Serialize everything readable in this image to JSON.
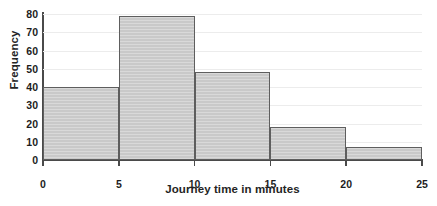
{
  "chart_data": {
    "type": "bar",
    "title": "",
    "subtitle": "",
    "xlabel": "Journey time in minutes",
    "ylabel": "Frequency",
    "categories": [
      "0-5",
      "5-10",
      "10-15",
      "15-20",
      "20-25"
    ],
    "bin_edges": [
      0,
      5,
      10,
      15,
      20,
      25
    ],
    "values": [
      40,
      79,
      48,
      18,
      7
    ],
    "xlim": [
      0,
      25
    ],
    "ylim": [
      0,
      80
    ],
    "xticks": [
      "0",
      "5",
      "10",
      "15",
      "20",
      "25"
    ],
    "yticks": [
      "0",
      "10",
      "20",
      "30",
      "40",
      "50",
      "60",
      "70",
      "80"
    ],
    "grid": true,
    "grid_axis": "y",
    "legend": false,
    "legend_position": "none",
    "bar_fill_color": "#c9c9c9",
    "bar_edge_color": "#5e5e5e",
    "axis_color": "#4a4a4a",
    "grid_color": "#ececec",
    "background_color": "#ffffff",
    "text_color": "#1d1d1d"
  }
}
